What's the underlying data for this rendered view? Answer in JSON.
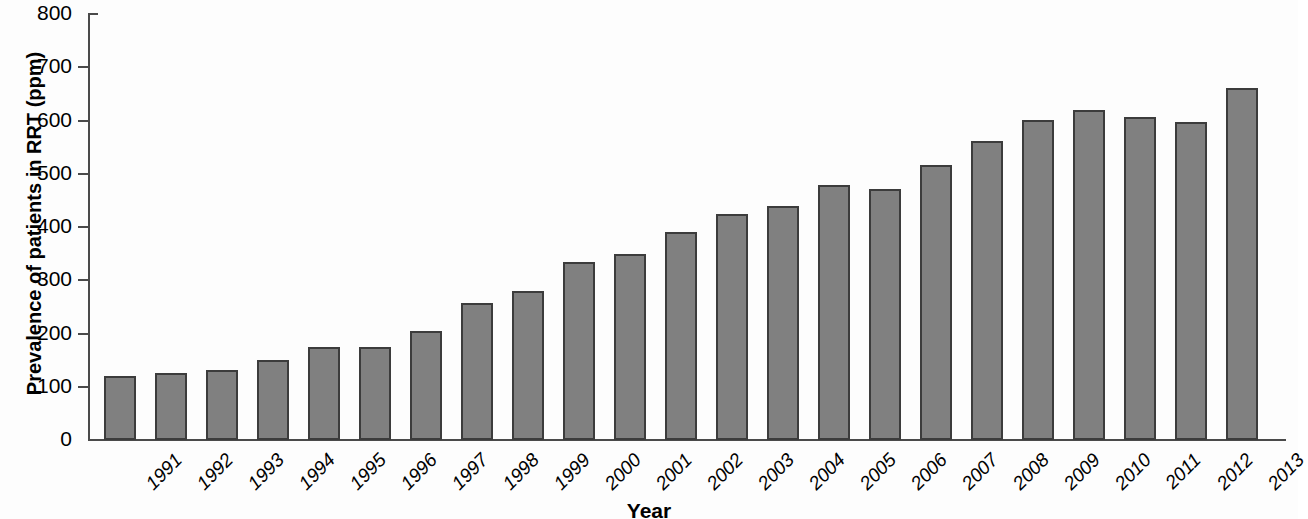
{
  "chart_data": {
    "type": "bar",
    "title": "",
    "xlabel": "Year",
    "ylabel": "Prevalence of patients in RRT (ppm)",
    "ylim": [
      0,
      800
    ],
    "yticks": [
      0,
      100,
      200,
      300,
      400,
      500,
      600,
      700,
      800
    ],
    "ytick_labels": [
      "0",
      "100",
      "200",
      "300",
      "400",
      "500",
      "600",
      "700",
      "800"
    ],
    "grid": false,
    "legend": null,
    "bar_color": "#808080",
    "bar_edge_color": "#3c3c3c",
    "categories": [
      "1991",
      "1992",
      "1993",
      "1994",
      "1995",
      "1996",
      "1997",
      "1998",
      "1999",
      "2000",
      "2001",
      "2002",
      "2003",
      "2004",
      "2005",
      "2006",
      "2007",
      "2008",
      "2009",
      "2010",
      "2011",
      "2012",
      "2013"
    ],
    "values": [
      120,
      125,
      131,
      150,
      174,
      174,
      204,
      258,
      280,
      334,
      350,
      390,
      424,
      440,
      479,
      471,
      516,
      562,
      601,
      619,
      607,
      598,
      662
    ]
  },
  "axis": {
    "y_title": "Prevalence of patients in RRT (ppm)",
    "x_title": "Year"
  }
}
